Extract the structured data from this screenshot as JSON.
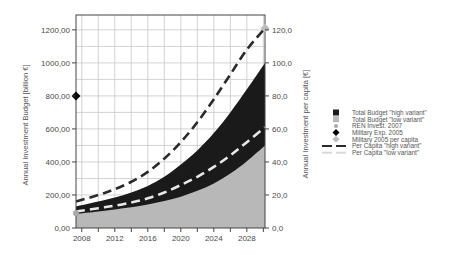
{
  "chart_data": {
    "type": "area",
    "title": "",
    "xlabel": "",
    "ylabel": "Annual Investment Budget [billion €]",
    "y2label": "Annual Investment per capita [€]",
    "xlim": [
      2007.3,
      2030.2
    ],
    "ylim": [
      0,
      1290
    ],
    "y2lim": [
      0,
      129
    ],
    "grid": true,
    "legend_position": "right",
    "x_ticks": [
      2008,
      2012,
      2016,
      2020,
      2024,
      2028
    ],
    "x_tick_labels": [
      "2008",
      "2012",
      "2016",
      "2020",
      "2024",
      "2028"
    ],
    "y_ticks": [
      0,
      200,
      400,
      600,
      800,
      1000,
      1200
    ],
    "y_tick_labels": [
      "0,00",
      "200,00",
      "400,00",
      "600,00",
      "800,00",
      "1000,00",
      "1200,00"
    ],
    "y2_ticks": [
      0,
      20,
      40,
      60,
      80,
      100,
      120
    ],
    "y2_tick_labels": [
      "0,0",
      "20,0",
      "40,0",
      "60,0",
      "80,0",
      "100,0",
      "120,0"
    ],
    "x": [
      2007.3,
      2010,
      2012,
      2014,
      2016,
      2018,
      2020,
      2022,
      2024,
      2026,
      2028,
      2030.2
    ],
    "series": [
      {
        "name": "Total Budget \"high variant\"",
        "axis": "left",
        "kind": "area",
        "color": "#1a1a1a",
        "values": [
          130,
          160,
          185,
          215,
          255,
          310,
          385,
          470,
          575,
          700,
          840,
          1000
        ]
      },
      {
        "name": "Total Budget \"low variant\"",
        "axis": "left",
        "kind": "area",
        "color": "#b8b8b8",
        "values": [
          85,
          100,
          112,
          125,
          142,
          163,
          190,
          225,
          270,
          330,
          405,
          500
        ]
      },
      {
        "name": "Per Capita \"high variant\"",
        "axis": "right",
        "kind": "dashed-line",
        "color": "#2a2a2a",
        "values": [
          16,
          20,
          23.5,
          28,
          34,
          42,
          52,
          64,
          78,
          93,
          108,
          121
        ]
      },
      {
        "name": "Per Capita \"low variant\"",
        "axis": "right",
        "kind": "dashed-line",
        "color": "#e8e8e8",
        "values": [
          10,
          12,
          13.5,
          15.5,
          18,
          21.5,
          26,
          31,
          37,
          44,
          52,
          61
        ]
      }
    ],
    "points": [
      {
        "name": "REN Invest. 2007",
        "axis": "left",
        "x": 2007.3,
        "y": 90,
        "marker": "circle",
        "color": "#a8a8a8"
      },
      {
        "name": "Military Exp. 2005",
        "axis": "left",
        "x": 2007.3,
        "y": 800,
        "marker": "diamond",
        "color": "#000000"
      },
      {
        "name": "Military 2005 per capita",
        "axis": "right",
        "x": 2030.2,
        "y": 121,
        "marker": "diamond",
        "color": "#bdbdbd"
      }
    ],
    "legend": [
      {
        "label": "Total Budget \"high variant\"",
        "symbol": "square",
        "color": "#1a1a1a"
      },
      {
        "label": "Total Budget \"low variant\"",
        "symbol": "square",
        "color": "#b8b8b8"
      },
      {
        "label": "REN Invest. 2007",
        "symbol": "circle",
        "color": "#a8a8a8"
      },
      {
        "label": "Military Exp. 2005",
        "symbol": "diamond",
        "color": "#000000"
      },
      {
        "label": "Military 2005 per capita",
        "symbol": "diamond",
        "color": "#bdbdbd"
      },
      {
        "label": "Per Capita \"high variant\"",
        "symbol": "dash-dark",
        "color": "#2a2a2a"
      },
      {
        "label": "Per Capita \"low variant\"",
        "symbol": "dash-light",
        "color": "#d8d8d8"
      }
    ]
  }
}
